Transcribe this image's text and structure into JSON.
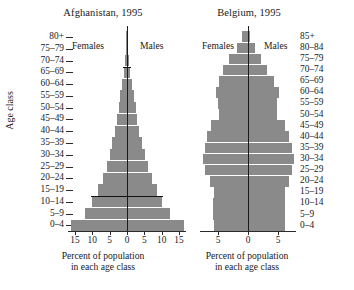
{
  "figure": {
    "x_caption_line1": "Percent of population",
    "x_caption_line2": "in each age class",
    "y_axis_label": "Age class",
    "bar_color": "#8a8a8a",
    "axis_color": "#2a2a2a"
  },
  "chart_data": [
    {
      "type": "bar",
      "title": "Afghanistan, 1995",
      "subtype": "population-pyramid",
      "xlabel": "Percent of population in each age class",
      "ylabel": "Age class",
      "xlim": [
        -17,
        17
      ],
      "xticks": [
        -15,
        -10,
        -5,
        0,
        5,
        10,
        15
      ],
      "xtick_labels": [
        "15",
        "10",
        "5",
        "0",
        "5",
        "10",
        "15"
      ],
      "grid": false,
      "legend_position": "inside-top",
      "left_series_label": "Females",
      "right_series_label": "Males",
      "categories": [
        "0-4",
        "5-9",
        "10-14",
        "15-19",
        "20-24",
        "25-29",
        "30-34",
        "35-39",
        "40-44",
        "45-49",
        "50-54",
        "55-59",
        "60-64",
        "65-69",
        "70-74",
        "75-79",
        "80+"
      ],
      "series": [
        {
          "name": "Females",
          "values": [
            16.2,
            12.2,
            10.0,
            8.3,
            7.0,
            5.9,
            5.0,
            4.2,
            3.5,
            2.9,
            2.4,
            1.9,
            1.5,
            1.0,
            0.6,
            0.3,
            0.15
          ]
        },
        {
          "name": "Males",
          "values": [
            16.4,
            12.4,
            10.2,
            8.5,
            7.2,
            6.0,
            5.1,
            4.3,
            3.6,
            3.0,
            2.5,
            2.0,
            1.5,
            1.0,
            0.6,
            0.3,
            0.15
          ]
        }
      ],
      "annotations": [
        {
          "label": "reference line at top of 10-14 class",
          "category": "10-14"
        },
        {
          "label": "reference line at top of 65-69 class",
          "category": "65-69"
        }
      ]
    },
    {
      "type": "bar",
      "title": "Belgium, 1995",
      "subtype": "population-pyramid",
      "xlabel": "Percent of population in each age class",
      "ylabel": "Age class",
      "xlim": [
        -8,
        8
      ],
      "xticks": [
        -5,
        0,
        5
      ],
      "xtick_labels": [
        "5",
        "0",
        "5"
      ],
      "grid": false,
      "legend_position": "inside-top",
      "left_series_label": "Females",
      "right_series_label": "Males",
      "categories": [
        "0-4",
        "5-9",
        "10-14",
        "15-19",
        "20-24",
        "25-29",
        "30-34",
        "35-39",
        "40-44",
        "45-49",
        "50-54",
        "55-59",
        "60-64",
        "65-69",
        "70-74",
        "75-79",
        "80-84",
        "85+"
      ],
      "series": [
        {
          "name": "Females",
          "values": [
            5.7,
            5.8,
            5.8,
            5.7,
            6.4,
            7.1,
            7.5,
            7.2,
            6.8,
            6.1,
            4.9,
            5.0,
            5.4,
            4.9,
            4.1,
            3.1,
            1.9,
            1.0
          ]
        },
        {
          "name": "Males",
          "values": [
            6.1,
            6.2,
            6.2,
            6.1,
            6.8,
            7.4,
            7.7,
            7.3,
            6.9,
            6.2,
            4.9,
            4.9,
            5.1,
            4.3,
            3.2,
            2.1,
            1.1,
            0.4
          ]
        }
      ],
      "annotations": []
    }
  ]
}
